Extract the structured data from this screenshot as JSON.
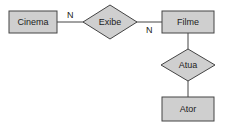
{
  "diagram": {
    "type": "entity-relationship",
    "colors": {
      "shape_fill": "#cfcfcf",
      "stroke": "#444444",
      "text": "#222222"
    },
    "entities": [
      {
        "id": "cinema",
        "label": "Cinema"
      },
      {
        "id": "filme",
        "label": "Filme"
      },
      {
        "id": "ator",
        "label": "Ator"
      }
    ],
    "relationships": [
      {
        "id": "exibe",
        "label": "Exibe",
        "connects": [
          "cinema",
          "filme"
        ]
      },
      {
        "id": "atua",
        "label": "Atua",
        "connects": [
          "filme",
          "ator"
        ]
      }
    ],
    "cardinalities": [
      {
        "near": "cinema",
        "relationship": "exibe",
        "label": "N"
      },
      {
        "near": "filme",
        "relationship": "exibe",
        "label": "N"
      }
    ]
  }
}
